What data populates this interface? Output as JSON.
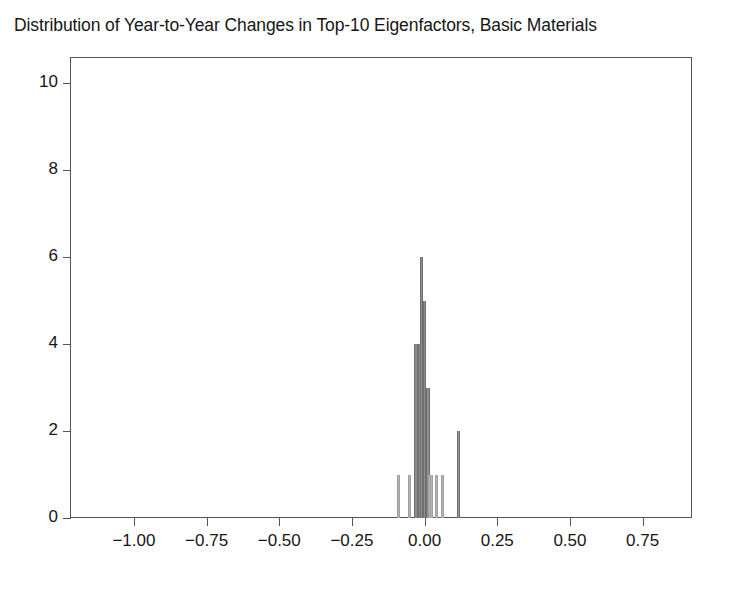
{
  "chart_data": {
    "type": "bar",
    "title": "Distribution of Year-to-Year Changes in Top-10 Eigenfactors, Basic Materials",
    "xlabel": "",
    "ylabel": "",
    "xlim": [
      -1.22,
      0.92
    ],
    "ylim": [
      0,
      10.6
    ],
    "xticks": [
      -1.0,
      -0.75,
      -0.5,
      -0.25,
      0.0,
      0.25,
      0.5,
      0.75
    ],
    "xtick_labels": [
      "−1.00",
      "−0.75",
      "−0.50",
      "−0.25",
      "0.00",
      "0.25",
      "0.50",
      "0.75"
    ],
    "yticks": [
      0,
      2,
      4,
      6,
      8,
      10
    ],
    "ytick_labels": [
      "0",
      "2",
      "4",
      "6",
      "8",
      "10"
    ],
    "grid": false,
    "legend": null,
    "bin_width": 0.0115,
    "bar_color": "#9a9a9a",
    "bar_edge_color": "#6e6e6e",
    "frame_color": "#555555",
    "background": "#ffffff",
    "categories": [
      -0.0888,
      -0.053,
      -0.03,
      -0.0185,
      -0.0115,
      0.0,
      0.0115,
      0.0175,
      0.023,
      0.041,
      0.062,
      0.1175
    ],
    "values": [
      1,
      1,
      4,
      4,
      6,
      5,
      3,
      1,
      1,
      1,
      1,
      2
    ],
    "series": [
      {
        "name": "Year-to-Year Change Count",
        "values": [
          1,
          1,
          4,
          4,
          6,
          5,
          3,
          1,
          1,
          1,
          1,
          2
        ]
      }
    ]
  },
  "figure": {
    "title": "Distribution of Year-to-Year Changes in Top-10 Eigenfactors, Basic Materials"
  }
}
